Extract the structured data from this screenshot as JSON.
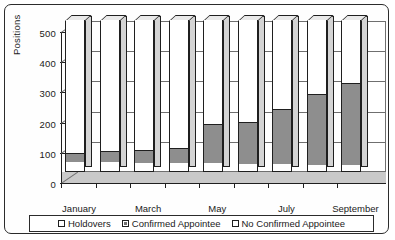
{
  "chart_data": {
    "type": "bar",
    "subtype": "stacked-column-3d",
    "title": "",
    "xlabel": "",
    "ylabel": "Positions",
    "ylim": [
      0,
      500
    ],
    "yticks": [
      0,
      100,
      200,
      300,
      400,
      500
    ],
    "grid": true,
    "legend_position": "bottom",
    "categories": [
      "January",
      "February",
      "March",
      "April",
      "May",
      "June",
      "July",
      "August",
      "September"
    ],
    "tick_labels": [
      "January",
      "March",
      "May",
      "July",
      "September"
    ],
    "series": [
      {
        "name": "Holdovers",
        "color": "#ffffff",
        "values": [
          30,
          30,
          28,
          25,
          25,
          22,
          22,
          20,
          20
        ]
      },
      {
        "name": "Confirmed Appointee",
        "color": "#8e8e8e",
        "values": [
          30,
          35,
          40,
          50,
          130,
          140,
          185,
          235,
          270
        ]
      },
      {
        "name": "No Confirmed Appointee",
        "color": "#ffffff",
        "values": [
          440,
          435,
          432,
          425,
          345,
          338,
          293,
          245,
          210
        ]
      }
    ],
    "totals": [
      500,
      500,
      500,
      500,
      500,
      500,
      500,
      500,
      500
    ]
  },
  "legend": {
    "items": [
      {
        "label": "Holdovers",
        "swatch": "white"
      },
      {
        "label": "Confirmed Appointee",
        "swatch": "dark"
      },
      {
        "label": "No Confirmed Appointee",
        "swatch": "white"
      }
    ]
  }
}
